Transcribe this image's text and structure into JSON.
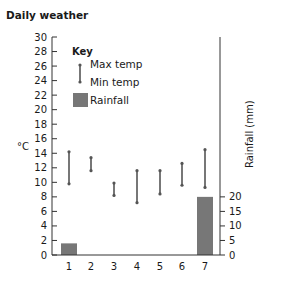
{
  "title": "Daily weather",
  "chart_data": {
    "type": "bar",
    "title": "Daily weather",
    "xlabel": "",
    "ylabel": "°C",
    "y2label": "Rainfall (mm)",
    "categories": [
      "1",
      "2",
      "3",
      "4",
      "5",
      "6",
      "7"
    ],
    "ylim": [
      0,
      30
    ],
    "y_ticks": [
      0,
      2,
      4,
      6,
      8,
      10,
      12,
      14,
      16,
      18,
      20,
      22,
      24,
      26,
      28,
      30
    ],
    "y2lim": [
      0,
      20
    ],
    "y2_ticks": [
      0,
      5,
      10,
      15,
      20
    ],
    "grid": false,
    "legend_position": "upper-left-inside",
    "series": [
      {
        "name": "Max temp",
        "kind": "range-top",
        "values": [
          14.2,
          13.4,
          9.9,
          11.6,
          11.6,
          12.6,
          14.5
        ]
      },
      {
        "name": "Min temp",
        "kind": "range-bottom",
        "values": [
          9.8,
          11.6,
          8.2,
          7.2,
          8.4,
          9.6,
          9.3
        ]
      },
      {
        "name": "Rainfall",
        "kind": "bar",
        "axis": "right",
        "values": [
          4,
          0,
          0,
          0,
          0,
          0,
          20
        ]
      }
    ]
  },
  "key": {
    "title": "Key",
    "max_label": "Max temp",
    "min_label": "Min temp",
    "rain_label": "Rainfall"
  },
  "colors": {
    "axis": "#333333",
    "range": "#555555",
    "bar": "#777777"
  }
}
